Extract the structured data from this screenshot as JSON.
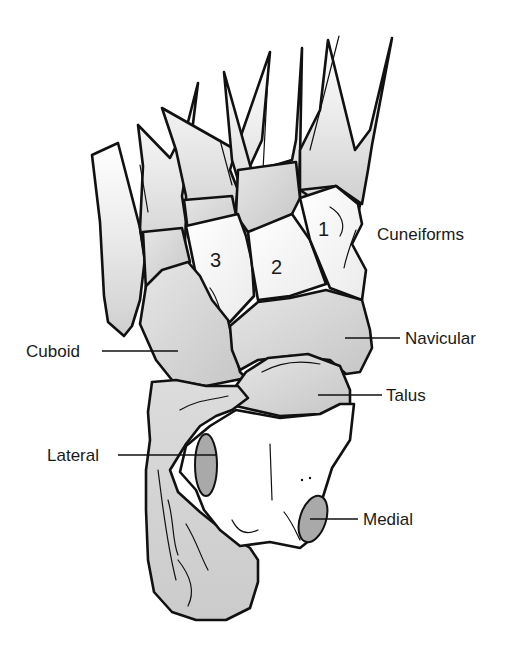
{
  "figure": {
    "colors": {
      "background": "#ffffff",
      "bone_light": "#f4f4f4",
      "bone_mid": "#d8d8d8",
      "bone_dark": "#c2c2c2",
      "facet": "#a9a9a9",
      "outline": "#111111"
    }
  },
  "labels": {
    "cuneiforms": "Cuneiforms",
    "navicular": "Navicular",
    "cuboid": "Cuboid",
    "talus": "Talus",
    "lateral": "Lateral",
    "medial": "Medial"
  },
  "cuneiform_numbers": {
    "first": "1",
    "second": "2",
    "third": "3"
  }
}
